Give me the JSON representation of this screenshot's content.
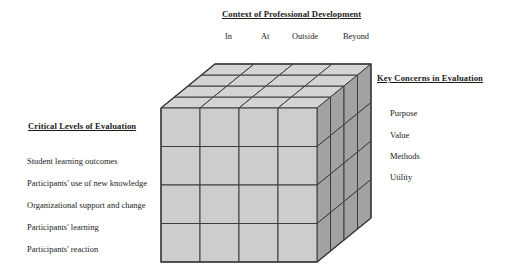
{
  "diagram": {
    "top_axis": {
      "title": "Context of Professional Development",
      "categories": [
        "In",
        "At",
        "Outside",
        "Beyond"
      ]
    },
    "left_axis": {
      "title": "Critical Levels of Evaluation",
      "categories": [
        "Student learning outcomes",
        "Participants' use of new knowledge",
        "Organizational support and change",
        "Participants' learning",
        "Participants' reaction"
      ]
    },
    "right_axis": {
      "title": "Key Concerns in Evaluation",
      "categories": [
        "Purpose",
        "Value",
        "Methods",
        "Utility"
      ]
    },
    "cube": {
      "divisions": 4,
      "front_face_color": "#cdcdcd",
      "top_face_color": "#d4d4d4",
      "side_face_color": "#a2a2a2",
      "edge_color": "#3c3c3c"
    }
  }
}
